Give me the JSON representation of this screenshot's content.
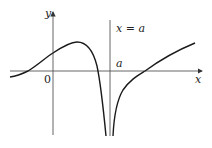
{
  "diagram": {
    "type": "function graph with vertical asymptote",
    "labels": {
      "y_axis": "y",
      "x_axis": "x",
      "origin": "0",
      "asymptote": "x = a",
      "a_tick": "a"
    },
    "colors": {
      "axis": "#555555",
      "curve": "#1a1a1a",
      "text": "#222222",
      "background": "#ffffff"
    }
  }
}
